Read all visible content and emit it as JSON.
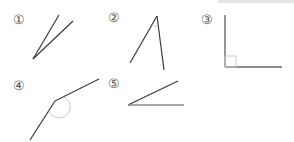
{
  "figure": {
    "title": "",
    "angles": [
      {
        "id": 1,
        "label": "①",
        "type": "acute",
        "label_pos": [
          13,
          12
        ]
      },
      {
        "id": 2,
        "label": "②",
        "type": "acute",
        "label_pos": [
          108,
          11
        ]
      },
      {
        "id": 3,
        "label": "③",
        "type": "right",
        "label_pos": [
          201,
          13
        ]
      },
      {
        "id": 4,
        "label": "④",
        "type": "obtuse",
        "label_pos": [
          13,
          78
        ]
      },
      {
        "id": 5,
        "label": "⑤",
        "type": "acute",
        "label_pos": [
          108,
          76
        ]
      }
    ],
    "colors": {
      "line": "#3a3a3a",
      "arc": "#c8c8c8",
      "label": "#555555",
      "topbar": "#e4e4e4"
    }
  }
}
